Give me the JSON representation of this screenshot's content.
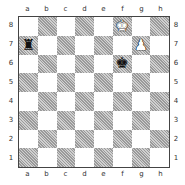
{
  "board": {
    "files": [
      "a",
      "b",
      "c",
      "d",
      "e",
      "f",
      "g",
      "h"
    ],
    "ranks": [
      "8",
      "7",
      "6",
      "5",
      "4",
      "3",
      "2",
      "1"
    ],
    "light_color": "#ffffff",
    "dark_color": "#b9b9b9",
    "pieces": [
      {
        "square": "f8",
        "type": "king",
        "color": "white",
        "glyph": "♚"
      },
      {
        "square": "a7",
        "type": "rook",
        "color": "black",
        "glyph": "♜"
      },
      {
        "square": "g7",
        "type": "pawn",
        "color": "white",
        "glyph": "♟"
      },
      {
        "square": "f6",
        "type": "king",
        "color": "black",
        "glyph": "♚"
      }
    ]
  }
}
